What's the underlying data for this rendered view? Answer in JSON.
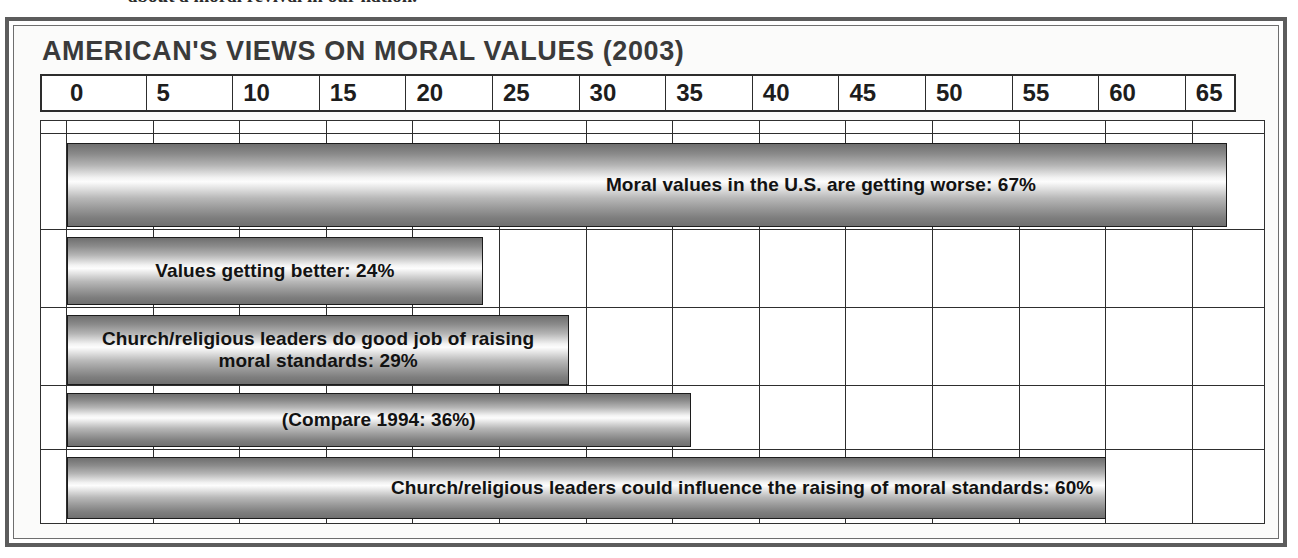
{
  "page": {
    "clipped_caption": "about a moral revival in our nation."
  },
  "chart": {
    "title": "AMERICAN'S VIEWS ON MORAL VALUES (2003)"
  },
  "chart_data": {
    "type": "bar",
    "orientation": "horizontal",
    "title": "AMERICAN'S VIEWS ON MORAL VALUES (2003)",
    "xlabel": "",
    "ylabel": "",
    "xlim": [
      0,
      70
    ],
    "grid": true,
    "legend": "none",
    "tick_labels": [
      "0",
      "5",
      "10",
      "15",
      "20",
      "25",
      "30",
      "35",
      "40",
      "45",
      "50",
      "55",
      "60",
      "65"
    ],
    "tick_values": [
      0,
      5,
      10,
      15,
      20,
      25,
      30,
      35,
      40,
      45,
      50,
      55,
      60,
      65
    ],
    "categories": [
      "Moral values in the U.S. are getting worse",
      "Values getting better",
      "Church/religious leaders do good job of raising moral standards",
      "(Compare 1994)",
      "Church/religious leaders could influence the raising of moral standards"
    ],
    "values": [
      67,
      24,
      29,
      36,
      60
    ],
    "bars": [
      {
        "label": "Moral values in the U.S. are getting worse: 67%",
        "value": 67,
        "label_align": "right"
      },
      {
        "label": "Values getting better: 24%",
        "value": 24,
        "label_align": "center"
      },
      {
        "label": "Church/religious leaders do good job of raising\nmoral standards: 29%",
        "value": 29,
        "label_align": "center"
      },
      {
        "label": "(Compare 1994: 36%)",
        "value": 36,
        "label_align": "center"
      },
      {
        "label": "Church/religious leaders could influence the raising of moral standards: 60%",
        "value": 60,
        "label_align": "right"
      }
    ],
    "colors": {
      "bar_dark": "#6f6f6f",
      "bar_light": "#fdfdfd",
      "bar_outline": "#1c1c1c",
      "frame": "#5c5c5c",
      "text": "#1d1d1d"
    }
  }
}
